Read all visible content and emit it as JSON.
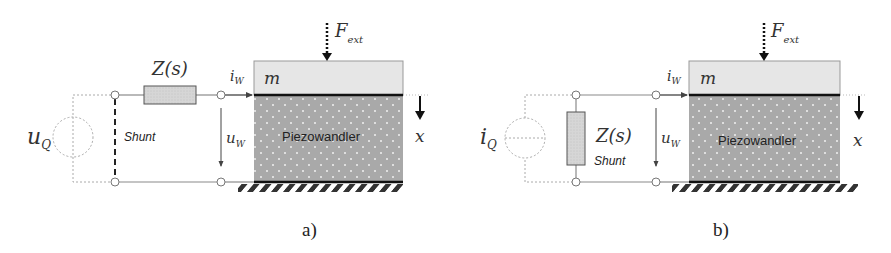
{
  "figure": {
    "panels": [
      {
        "id": "a",
        "caption": "a)",
        "source_label": "u",
        "source_sub": "Q",
        "source_type": "voltage-source",
        "impedance_label": "Z(s)",
        "shunt_label": "Shunt",
        "current_label": "i",
        "current_sub": "W",
        "voltage_label": "u",
        "voltage_sub": "W",
        "mass_label": "m",
        "piezo_label": "Piezowandler",
        "force_label": "F",
        "force_sub": "ext",
        "displacement_label": "x"
      },
      {
        "id": "b",
        "caption": "b)",
        "source_label": "i",
        "source_sub": "Q",
        "source_type": "current-source",
        "impedance_label": "Z(s)",
        "shunt_label": "Shunt",
        "current_label": "i",
        "current_sub": "W",
        "voltage_label": "u",
        "voltage_sub": "W",
        "mass_label": "m",
        "piezo_label": "Piezowandler",
        "force_label": "F",
        "force_sub": "ext",
        "displacement_label": "x"
      }
    ],
    "colors": {
      "wire": "#8a8a8a",
      "dotted": "#aaaaaa",
      "mass_fill": "#e6e6e6",
      "piezo_fill": "#a9a9a9",
      "impedance_fill": "#d4d4d4",
      "ground": "#333333"
    }
  }
}
